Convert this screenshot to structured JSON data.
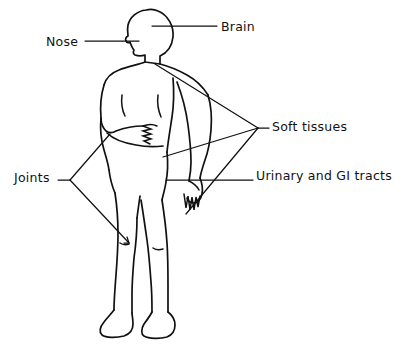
{
  "diagram": {
    "canvas": {
      "width": 400,
      "height": 348
    },
    "colors": {
      "background": "#ffffff",
      "line": "#111111",
      "text": "#111111"
    },
    "figure": {
      "name": "human-figure-outline",
      "description": "Standing human figure line drawing, head in profile facing left, left arm crossed over abdomen, right arm at side"
    },
    "labels": [
      {
        "id": "brain",
        "text": "Brain",
        "side": "right",
        "x": 221,
        "y": 21,
        "leader": "horizontal line from text to top of head"
      },
      {
        "id": "nose",
        "text": "Nose",
        "side": "left",
        "x": 46,
        "y": 36,
        "leader": "horizontal line from text to face profile"
      },
      {
        "id": "soft-tissues",
        "text": "Soft tissues",
        "side": "right",
        "x": 272,
        "y": 121,
        "leader": "three lines fanning from a vertex to shoulder, abdomen and thigh"
      },
      {
        "id": "urinary-gi-tracts",
        "text": "Urinary and GI tracts",
        "side": "right",
        "x": 256,
        "y": 170,
        "leader": "horizontal line from text across to hip"
      },
      {
        "id": "joints",
        "text": "Joints",
        "side": "left",
        "x": 14,
        "y": 172,
        "leader": "forked line from vertex to elbow and to knee"
      }
    ]
  }
}
